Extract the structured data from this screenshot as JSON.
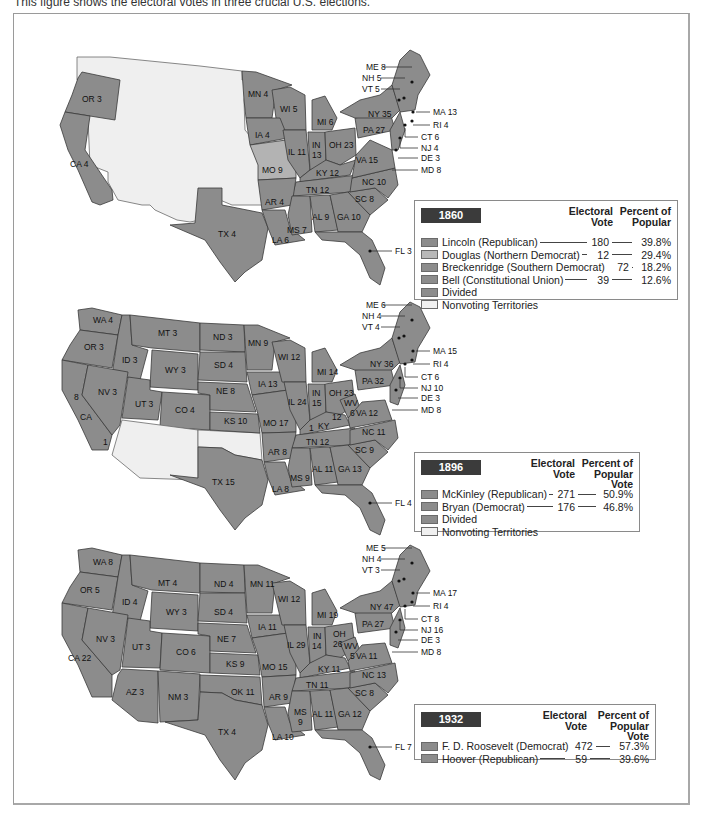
{
  "caption": "This figure shows the electoral votes in three crucial U.S. elections.",
  "colors": {
    "state_fill": "#8c8c8c",
    "douglas_fill": "#b3b3b3",
    "nonvoting_fill": "#efefef",
    "badge_bg": "#3b3b3b",
    "border": "#3a3a3a"
  },
  "maps": [
    {
      "year": "1860",
      "state_labels": [
        {
          "id": "OR",
          "text": "OR 3"
        },
        {
          "id": "CA",
          "text": "CA 4"
        },
        {
          "id": "TX",
          "text": "TX 4"
        },
        {
          "id": "MN",
          "text": "MN 4"
        },
        {
          "id": "WI",
          "text": "WI 5"
        },
        {
          "id": "IA",
          "text": "IA 4"
        },
        {
          "id": "MO",
          "text": "MO 9"
        },
        {
          "id": "AR",
          "text": "AR 4"
        },
        {
          "id": "LA",
          "text": "LA 6"
        },
        {
          "id": "MS",
          "text": "MS 7"
        },
        {
          "id": "AL",
          "text": "AL 9"
        },
        {
          "id": "GA",
          "text": "GA 10"
        },
        {
          "id": "SC",
          "text": "SC 8"
        },
        {
          "id": "NC",
          "text": "NC 10"
        },
        {
          "id": "TN",
          "text": "TN 12"
        },
        {
          "id": "KY",
          "text": "KY 12"
        },
        {
          "id": "VA",
          "text": "VA 15"
        },
        {
          "id": "IL",
          "text": "IL 11"
        },
        {
          "id": "IN",
          "text": "IN"
        },
        {
          "id": "IN2",
          "text": "13"
        },
        {
          "id": "OH",
          "text": "OH 23"
        },
        {
          "id": "MI",
          "text": "MI 6"
        },
        {
          "id": "PA",
          "text": "PA 27"
        },
        {
          "id": "NY",
          "text": "NY 35"
        }
      ],
      "callouts": [
        {
          "id": "ME",
          "text": "ME 8"
        },
        {
          "id": "NH",
          "text": "NH 5"
        },
        {
          "id": "VT",
          "text": "VT 5"
        },
        {
          "id": "MA",
          "text": "MA 13"
        },
        {
          "id": "RI",
          "text": "RI 4"
        },
        {
          "id": "CT",
          "text": "CT 6"
        },
        {
          "id": "NJ",
          "text": "NJ 4"
        },
        {
          "id": "DE",
          "text": "DE 3"
        },
        {
          "id": "MD",
          "text": "MD 8"
        },
        {
          "id": "FL",
          "text": "FL 3"
        }
      ],
      "legend": {
        "year": "1860",
        "col_vote": [
          "Electoral",
          "Vote"
        ],
        "col_pct": [
          "Percent of",
          "Popular"
        ],
        "rows": [
          {
            "name": "Lincoln (Republican)",
            "vote": "180",
            "pct": "39.8%",
            "swatch": "dark"
          },
          {
            "name": "Douglas (Northern Democrat)",
            "vote": "12",
            "pct": "29.4%",
            "swatch": "light"
          },
          {
            "name": "Breckenridge (Southern Democrat)",
            "vote": "72",
            "pct": "18.2%",
            "swatch": "dark"
          },
          {
            "name": "Bell (Constitutional Union)",
            "vote": "39",
            "pct": "12.6%",
            "swatch": "dark"
          },
          {
            "name": "Divided",
            "vote": "",
            "pct": "",
            "swatch": "dark"
          },
          {
            "name": "Nonvoting Territories",
            "vote": "",
            "pct": "",
            "swatch": "nv"
          }
        ]
      }
    },
    {
      "year": "1896",
      "state_labels": [
        {
          "id": "WA",
          "text": "WA 4"
        },
        {
          "id": "OR",
          "text": "OR 3"
        },
        {
          "id": "CA",
          "text": "CA"
        },
        {
          "id": "CA8",
          "text": "8"
        },
        {
          "id": "CA1",
          "text": "1"
        },
        {
          "id": "ID",
          "text": "ID 3"
        },
        {
          "id": "NV",
          "text": "NV 3"
        },
        {
          "id": "MT",
          "text": "MT 3"
        },
        {
          "id": "WY",
          "text": "WY 3"
        },
        {
          "id": "UT",
          "text": "UT 3"
        },
        {
          "id": "CO",
          "text": "CO 4"
        },
        {
          "id": "ND",
          "text": "ND 3"
        },
        {
          "id": "SD",
          "text": "SD 4"
        },
        {
          "id": "NE",
          "text": "NE 8"
        },
        {
          "id": "KS",
          "text": "KS 10"
        },
        {
          "id": "TX",
          "text": "TX 15"
        },
        {
          "id": "MN",
          "text": "MN 9"
        },
        {
          "id": "IA",
          "text": "IA 13"
        },
        {
          "id": "MO",
          "text": "MO 17"
        },
        {
          "id": "AR",
          "text": "AR 8"
        },
        {
          "id": "LA",
          "text": "LA 8"
        },
        {
          "id": "WI",
          "text": "WI 12"
        },
        {
          "id": "IL",
          "text": "IL 24"
        },
        {
          "id": "MI",
          "text": "MI 14"
        },
        {
          "id": "IN",
          "text": "IN"
        },
        {
          "id": "IN2",
          "text": "15"
        },
        {
          "id": "OH",
          "text": "OH 23"
        },
        {
          "id": "KY",
          "text": "KY"
        },
        {
          "id": "KY12",
          "text": "12"
        },
        {
          "id": "KY1",
          "text": "1"
        },
        {
          "id": "TN",
          "text": "TN 12"
        },
        {
          "id": "MS",
          "text": "MS 9"
        },
        {
          "id": "AL",
          "text": "AL 11"
        },
        {
          "id": "GA",
          "text": "GA 13"
        },
        {
          "id": "SC",
          "text": "SC 9"
        },
        {
          "id": "NC",
          "text": "NC 11"
        },
        {
          "id": "VA",
          "text": "VA 12"
        },
        {
          "id": "WV",
          "text": "WV"
        },
        {
          "id": "WV2",
          "text": "6"
        },
        {
          "id": "PA",
          "text": "PA 32"
        },
        {
          "id": "NY",
          "text": "NY 36"
        }
      ],
      "callouts": [
        {
          "id": "ME",
          "text": "ME 6"
        },
        {
          "id": "NH",
          "text": "NH 4"
        },
        {
          "id": "VT",
          "text": "VT 4"
        },
        {
          "id": "MA",
          "text": "MA 15"
        },
        {
          "id": "RI",
          "text": "RI 4"
        },
        {
          "id": "CT",
          "text": "CT 6"
        },
        {
          "id": "NJ",
          "text": "NJ 10"
        },
        {
          "id": "DE",
          "text": "DE 3"
        },
        {
          "id": "MD",
          "text": "MD 8"
        },
        {
          "id": "FL",
          "text": "FL 4"
        }
      ],
      "legend": {
        "year": "1896",
        "col_vote": [
          "Electoral",
          "Vote"
        ],
        "col_pct": [
          "Percent of",
          "Popular Vote"
        ],
        "rows": [
          {
            "name": "McKinley (Republican)",
            "vote": "271",
            "pct": "50.9%",
            "swatch": "dark"
          },
          {
            "name": "Bryan (Democrat)",
            "vote": "176",
            "pct": "46.8%",
            "swatch": "dark"
          },
          {
            "name": "Divided",
            "vote": "",
            "pct": "",
            "swatch": "dark"
          },
          {
            "name": "Nonvoting Territories",
            "vote": "",
            "pct": "",
            "swatch": "nv"
          }
        ]
      }
    },
    {
      "year": "1932",
      "state_labels": [
        {
          "id": "WA",
          "text": "WA 8"
        },
        {
          "id": "OR",
          "text": "OR 5"
        },
        {
          "id": "CA",
          "text": "CA 22"
        },
        {
          "id": "ID",
          "text": "ID 4"
        },
        {
          "id": "NV",
          "text": "NV 3"
        },
        {
          "id": "MT",
          "text": "MT 4"
        },
        {
          "id": "WY",
          "text": "WY 3"
        },
        {
          "id": "UT",
          "text": "UT 3"
        },
        {
          "id": "CO",
          "text": "CO 6"
        },
        {
          "id": "AZ",
          "text": "AZ 3"
        },
        {
          "id": "NM",
          "text": "NM 3"
        },
        {
          "id": "ND",
          "text": "ND 4"
        },
        {
          "id": "SD",
          "text": "SD 4"
        },
        {
          "id": "NE",
          "text": "NE 7"
        },
        {
          "id": "KS",
          "text": "KS 9"
        },
        {
          "id": "OK",
          "text": "OK 11"
        },
        {
          "id": "TX",
          "text": "TX 4"
        },
        {
          "id": "MN",
          "text": "MN 11"
        },
        {
          "id": "IA",
          "text": "IA 11"
        },
        {
          "id": "MO",
          "text": "MO 15"
        },
        {
          "id": "AR",
          "text": "AR 9"
        },
        {
          "id": "LA",
          "text": "LA 10"
        },
        {
          "id": "WI",
          "text": "WI 12"
        },
        {
          "id": "IL",
          "text": "IL 29"
        },
        {
          "id": "MI",
          "text": "MI 19"
        },
        {
          "id": "IN",
          "text": "IN"
        },
        {
          "id": "IN2",
          "text": "14"
        },
        {
          "id": "OH",
          "text": "OH"
        },
        {
          "id": "OH2",
          "text": "26"
        },
        {
          "id": "KY",
          "text": "KY 11"
        },
        {
          "id": "TN",
          "text": "TN 11"
        },
        {
          "id": "MS",
          "text": "MS"
        },
        {
          "id": "MS2",
          "text": "9"
        },
        {
          "id": "AL",
          "text": "AL 11"
        },
        {
          "id": "GA",
          "text": "GA 12"
        },
        {
          "id": "SC",
          "text": "SC 8"
        },
        {
          "id": "NC",
          "text": "NC 13"
        },
        {
          "id": "VA",
          "text": "VA 11"
        },
        {
          "id": "WV",
          "text": "WV"
        },
        {
          "id": "WV2",
          "text": "5"
        },
        {
          "id": "PA",
          "text": "PA 27"
        },
        {
          "id": "NY",
          "text": "NY 47"
        }
      ],
      "callouts": [
        {
          "id": "ME",
          "text": "ME 5"
        },
        {
          "id": "NH",
          "text": "NH 4"
        },
        {
          "id": "VT",
          "text": "VT 3"
        },
        {
          "id": "MA",
          "text": "MA 17"
        },
        {
          "id": "RI",
          "text": "RI 4"
        },
        {
          "id": "CT",
          "text": "CT 8"
        },
        {
          "id": "NJ",
          "text": "NJ 16"
        },
        {
          "id": "DE",
          "text": "DE 3"
        },
        {
          "id": "MD",
          "text": "MD 8"
        },
        {
          "id": "FL",
          "text": "FL 7"
        }
      ],
      "legend": {
        "year": "1932",
        "col_vote": [
          "Electoral",
          "Vote"
        ],
        "col_pct": [
          "Percent of",
          "Popular Vote"
        ],
        "rows": [
          {
            "name": "F. D. Roosevelt (Democrat)",
            "vote": "472",
            "pct": "57.3%",
            "swatch": "dark"
          },
          {
            "name": "Hoover (Republican)",
            "vote": "59",
            "pct": "39.6%",
            "swatch": "dark"
          }
        ]
      }
    }
  ]
}
